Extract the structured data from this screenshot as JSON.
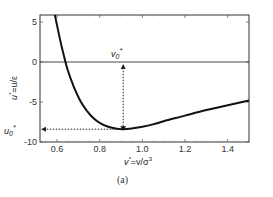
{
  "chart_data": {
    "type": "line",
    "title": "",
    "caption": "(a)",
    "xlabel": "v* = v/σ³",
    "ylabel": "u* = u/ε",
    "xlim": [
      0.52,
      1.5
    ],
    "ylim": [
      -10,
      6
    ],
    "xticks": [
      0.6,
      0.8,
      1.0,
      1.2,
      1.4
    ],
    "xtick_labels": [
      "0.6",
      "0.8",
      "1.0",
      "1.2",
      "1.4"
    ],
    "yticks": [
      5,
      0,
      -5,
      -10
    ],
    "ytick_labels": [
      "5",
      "0",
      "-5",
      "-10"
    ],
    "grid": false,
    "legend": null,
    "series": [
      {
        "name": "u*(v*)",
        "color": "#111111",
        "x": [
          0.59,
          0.61,
          0.63,
          0.65,
          0.68,
          0.71,
          0.74,
          0.77,
          0.8,
          0.84,
          0.88,
          0.91,
          0.95,
          1.0,
          1.05,
          1.1,
          1.2,
          1.3,
          1.4,
          1.5
        ],
        "y": [
          6.0,
          3.3,
          1.0,
          -1.0,
          -3.2,
          -4.9,
          -6.1,
          -7.0,
          -7.6,
          -8.1,
          -8.35,
          -8.4,
          -8.3,
          -8.1,
          -7.8,
          -7.4,
          -6.7,
          -6.0,
          -5.4,
          -4.8
        ]
      }
    ],
    "annotations": [
      {
        "text": "v0*",
        "label": "v₀*",
        "x": 0.91,
        "y": 1.1
      },
      {
        "text": "u0*",
        "label": "u₀*",
        "x": 0.45,
        "y": -8.4
      },
      {
        "type": "horizontal_line",
        "y": 0
      },
      {
        "type": "dotted_arrow_vertical",
        "x": 0.91,
        "from_y": -8.4,
        "to_y": 0
      },
      {
        "type": "dotted_arrow_horizontal",
        "y": -8.4,
        "from_x": 0.91,
        "to_x": 0.52
      }
    ]
  },
  "labels": {
    "xlabel_main": "v",
    "xlabel_rest": "=v/σ",
    "xlabel_sup": "3",
    "ylabel_main": "u",
    "ylabel_rest": "=u/ε",
    "v0": "v",
    "v0_sub": "0",
    "u0": "u",
    "u0_sub": "0",
    "star": "*",
    "caption": "(a)"
  }
}
